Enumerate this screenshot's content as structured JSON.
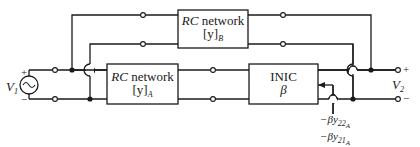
{
  "diagram": {
    "title": "",
    "blocks": {
      "rc_b": {
        "line1_italic": "RC",
        "line1_rest": " network",
        "line2_bracket": "[y]",
        "line2_sub": "B"
      },
      "rc_a": {
        "line1_italic": "RC",
        "line1_rest": " network",
        "line2_bracket": "[y]",
        "line2_sub": "A"
      },
      "inic": {
        "line1": "INIC",
        "line2": "β"
      }
    },
    "source": {
      "label": "V",
      "label_sub": "1",
      "plus": "+",
      "minus": "−",
      "symbol": "~"
    },
    "output": {
      "label": "V",
      "label_sub": "2",
      "plus": "+",
      "minus": "−"
    },
    "annotations": [
      {
        "prefix": "−βy",
        "sub": "22",
        "subsub": "A"
      },
      {
        "prefix": "−βy",
        "sub": "21",
        "subsub": "A"
      }
    ],
    "colors": {
      "line": "#1a1a1a",
      "background": "#ffffff"
    }
  }
}
